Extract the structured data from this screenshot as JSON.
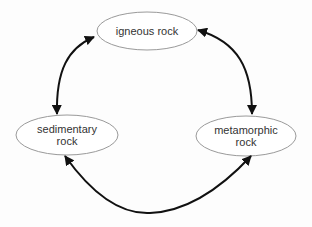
{
  "diagram": {
    "title": "",
    "nodes": [
      {
        "id": "igneous",
        "label": "igneous rock"
      },
      {
        "id": "sedimentary",
        "label_line1": "sedimentary",
        "label_line2": "rock"
      },
      {
        "id": "metamorphic",
        "label_line1": "metamorphic",
        "label_line2": "rock"
      }
    ],
    "edges": [
      {
        "from": "igneous",
        "to": "sedimentary",
        "bidirectional": true
      },
      {
        "from": "igneous",
        "to": "metamorphic",
        "bidirectional": true
      },
      {
        "from": "sedimentary",
        "to": "metamorphic",
        "bidirectional": true
      }
    ],
    "colors": {
      "node_border": "#9a9a9a",
      "node_fill": "#ffffff",
      "arrow": "#111111",
      "text": "#333333"
    }
  }
}
